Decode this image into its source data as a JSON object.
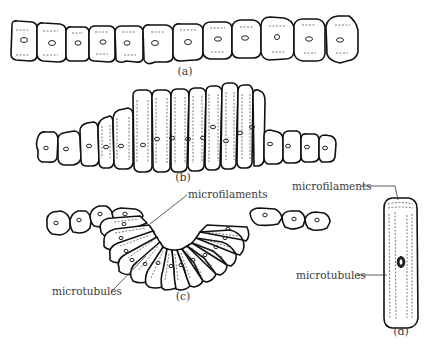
{
  "figure": {
    "panels": [
      {
        "id": "a",
        "label": "(a)",
        "description": "flat sheet of cuboidal epithelial cells"
      },
      {
        "id": "b",
        "label": "(b)",
        "description": "central cells elongating into columnar shape"
      },
      {
        "id": "c",
        "label": "(c)",
        "description": "cells wedge-shaped, sheet folding into a groove"
      },
      {
        "id": "d",
        "label": "(d)",
        "description": "single elongated cell with cytoskeleton"
      }
    ],
    "annotations": {
      "c_microfilaments": "microfilaments",
      "c_microtubules": "microtubules",
      "d_microfilaments": "microfilaments",
      "d_microtubules": "microtubules"
    }
  },
  "colors": {
    "background": "#ffffff",
    "outline": "#111111",
    "text": "#3a3a3a"
  }
}
